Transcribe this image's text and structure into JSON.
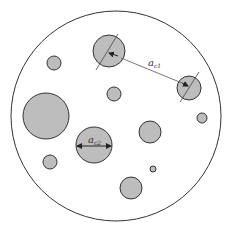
{
  "diagram": {
    "colors": {
      "matrix_fill": "#ffffff",
      "particle_fill": "#bdbdbd",
      "stroke": "#333333"
    },
    "labels": {
      "distance_label_main": "a",
      "distance_label_sub": "c1",
      "diameter_label_main": "a",
      "diameter_label_sub": "c2"
    },
    "particle_count": 11
  }
}
